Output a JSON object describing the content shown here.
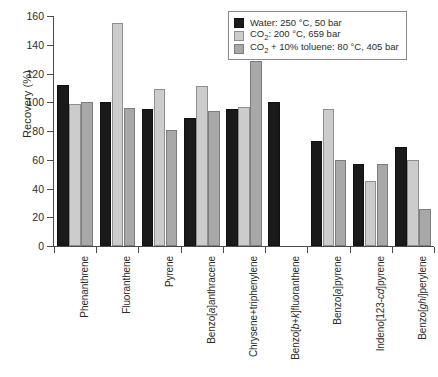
{
  "chart_data": {
    "type": "bar",
    "title": "",
    "xlabel": "",
    "ylabel": "Recovery (%)",
    "ylim": [
      0,
      160
    ],
    "yticks": [
      0,
      20,
      40,
      60,
      80,
      100,
      120,
      140,
      160
    ],
    "grid": false,
    "legend_position": "top-right",
    "categories": [
      "Phenanthrene",
      "Fluoranthene",
      "Pyrene",
      "Benzo[a]anthracene",
      "Chrysene+triphenylene",
      "Benzo[b+k]fluoranthene",
      "Benzo[a]pyrene",
      "Indeno[123-cd]pyrene",
      "Benzo[ghi]perylene"
    ],
    "series": [
      {
        "name": "Water: 250 °C, 50 bar",
        "color": "#1a1a1a",
        "values": [
          112,
          100,
          95,
          89,
          95,
          100,
          73,
          57,
          69
        ]
      },
      {
        "name": "CO2: 200 °C, 659 bar",
        "color": "#cccccc",
        "values": [
          99,
          155,
          109,
          111,
          97,
          null,
          95,
          45,
          60
        ]
      },
      {
        "name": "CO2 + 10% toluene: 80 °C, 405 bar",
        "color": "#a8a8a8",
        "values": [
          100,
          96,
          81,
          94,
          129,
          null,
          60,
          57,
          26
        ]
      }
    ]
  },
  "legend": {
    "items": [
      {
        "label_pre": "Water: 250 °C, 50 bar",
        "sub": "",
        "label_post": ""
      },
      {
        "label_pre": "CO",
        "sub": "2",
        "label_post": ": 200 °C, 659 bar"
      },
      {
        "label_pre": "CO",
        "sub": "2",
        "label_post": " + 10% toluene: 80 °C, 405 bar"
      }
    ]
  },
  "axis": {
    "y_title": "Recovery (%)"
  }
}
